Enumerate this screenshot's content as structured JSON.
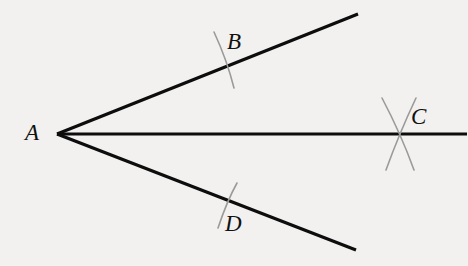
{
  "figure": {
    "background_color": "#f2f1ef",
    "width": 468,
    "height": 266,
    "ray_color": "#0d0d0d",
    "ray_width": 3.2,
    "tick_color": "#9a9a9a",
    "tick_width": 1.6,
    "label_color": "#111111",
    "label_font_size": 23
  },
  "vertex": {
    "name": "A",
    "x": 57,
    "y": 134
  },
  "labels": {
    "A": "A",
    "B": "B",
    "C": "C",
    "D": "D"
  },
  "rays": [
    {
      "id": "upper-ray",
      "from": "A",
      "through": "B",
      "start": [
        57,
        134
      ],
      "end": [
        358,
        14
      ]
    },
    {
      "id": "middle-ray",
      "from": "A",
      "through": "C",
      "start": [
        57,
        134
      ],
      "end": [
        467,
        134
      ]
    },
    {
      "id": "lower-ray",
      "from": "A",
      "through": "D",
      "start": [
        57,
        134
      ],
      "end": [
        356,
        250
      ]
    }
  ],
  "tick_marks": [
    {
      "id": "tick-B",
      "point": "B",
      "on_ray": "upper-ray",
      "count": 1,
      "cross_point": [
        226,
        61
      ],
      "strokes": [
        {
          "start": [
            214,
            32
          ],
          "end": [
            234,
            88
          ]
        }
      ]
    },
    {
      "id": "tick-C",
      "point": "C",
      "on_ray": "middle-ray",
      "count": 2,
      "cross_point": [
        400,
        134
      ],
      "strokes": [
        {
          "start": [
            382,
            98
          ],
          "end": [
            414,
            170
          ]
        },
        {
          "start": [
            416,
            98
          ],
          "end": [
            386,
            170
          ]
        }
      ]
    },
    {
      "id": "tick-D",
      "point": "D",
      "on_ray": "lower-ray",
      "count": 1,
      "cross_point": [
        227,
        200
      ],
      "strokes": [
        {
          "start": [
            237,
            183
          ],
          "end": [
            218,
            228
          ]
        }
      ]
    }
  ]
}
